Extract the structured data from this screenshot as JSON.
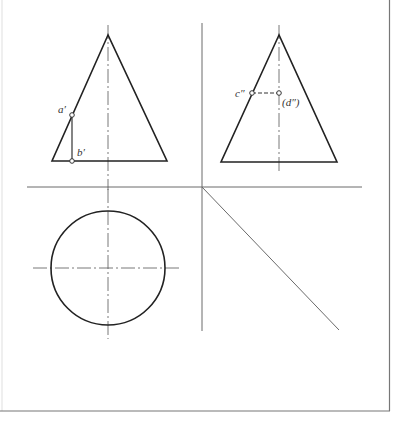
{
  "drawing": {
    "title": "Three-view projection of a cone with surface points",
    "colors": {
      "outline": "#222222",
      "axis": "#6a6a6a",
      "frame": "#777777",
      "background": "#ffffff"
    },
    "labels": {
      "a_prime": "a′",
      "b_prime": "b′",
      "c_double_prime": "c″",
      "d_double_prime": "(d″)"
    },
    "views": [
      {
        "name": "front-view",
        "shape": "isosceles triangle",
        "apex": [
          108,
          35
        ],
        "base": [
          [
            52,
            161
          ],
          [
            167,
            161
          ]
        ]
      },
      {
        "name": "side-view",
        "shape": "isosceles triangle",
        "apex": [
          279,
          35
        ],
        "base": [
          [
            221,
            162
          ],
          [
            337,
            162
          ]
        ]
      },
      {
        "name": "top-view",
        "shape": "circle",
        "center": [
          108,
          268
        ],
        "radius": 57
      }
    ],
    "points": [
      {
        "label": "a′",
        "x": 72,
        "y": 115
      },
      {
        "label": "b′",
        "x": 72,
        "y": 161
      },
      {
        "label": "c″",
        "x": 252,
        "y": 93
      },
      {
        "label": "(d″)",
        "x": 279,
        "y": 93
      }
    ]
  }
}
